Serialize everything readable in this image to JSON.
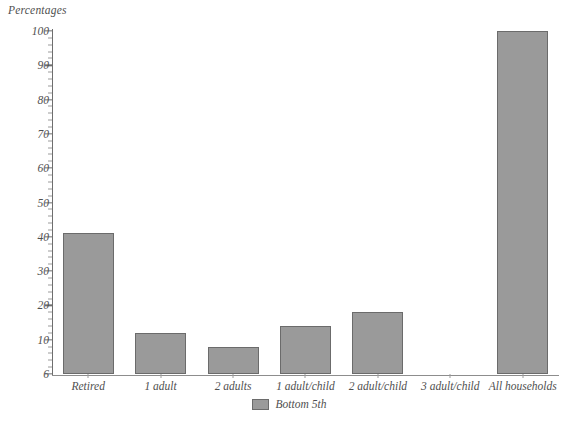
{
  "chart_data": {
    "type": "bar",
    "title": "",
    "xlabel": "",
    "ylabel": "Percentages",
    "ylim": [
      0,
      100
    ],
    "ytick_labels": [
      "100",
      "90",
      "80",
      "70",
      "60",
      "50",
      "40",
      "30",
      "20",
      "10",
      "6"
    ],
    "ytick_values": [
      100,
      90,
      80,
      70,
      60,
      50,
      40,
      30,
      20,
      10,
      0
    ],
    "minor_tick_step": 2,
    "grid": false,
    "legend_position": "bottom-center",
    "categories": [
      "Retired",
      "1 adult",
      "2 adults",
      "1 adult/child",
      "2 adult/child",
      "3 adult/child",
      "All households"
    ],
    "series": [
      {
        "name": "Bottom 5th",
        "color": "#9a9a9a",
        "values": [
          41,
          12,
          8,
          14,
          18,
          0,
          100
        ]
      }
    ]
  },
  "legend": {
    "entries": [
      {
        "label": "Bottom 5th",
        "swatch_name": "legend-swatch-bottom-5th"
      }
    ]
  },
  "colors": {
    "bar_fill": "#9a9a9a",
    "bar_stroke": "#6b6b6b",
    "axis": "#6e6e6e",
    "text": "#4f4f4f",
    "background": "#ffffff"
  }
}
